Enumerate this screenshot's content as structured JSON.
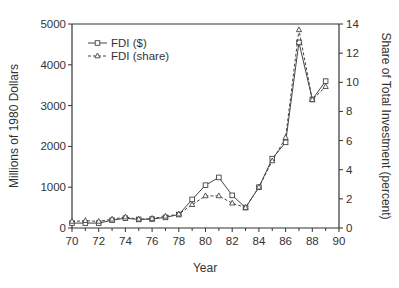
{
  "chart_data": {
    "type": "line",
    "title": "",
    "xlabel": "Year",
    "ylabel": "Millions of 1980 Dollars",
    "y2label": "Share of Total Investment (percent)",
    "x": [
      70,
      71,
      72,
      73,
      74,
      75,
      76,
      77,
      78,
      79,
      80,
      81,
      82,
      83,
      84,
      85,
      86,
      87,
      88,
      89
    ],
    "xlim": [
      70,
      90
    ],
    "ylim": [
      0,
      5000
    ],
    "y2lim": [
      0,
      14
    ],
    "x_ticks": [
      "70",
      "72",
      "74",
      "76",
      "78",
      "80",
      "82",
      "84",
      "86",
      "88",
      "90"
    ],
    "y_ticks": [
      "0",
      "1000",
      "2000",
      "3000",
      "4000",
      "5000"
    ],
    "y2_ticks": [
      "0",
      "2",
      "4",
      "6",
      "8",
      "10",
      "12",
      "14"
    ],
    "grid": false,
    "legend_position": "upper left",
    "series": [
      {
        "name": "FDI ($)",
        "axis": "left",
        "marker": "square",
        "line": "solid",
        "values": [
          120,
          120,
          120,
          190,
          240,
          210,
          220,
          260,
          330,
          700,
          1050,
          1240,
          800,
          500,
          1000,
          1700,
          2100,
          4550,
          3150,
          3600
        ]
      },
      {
        "name": "FDI (share)",
        "axis": "right",
        "marker": "triangle",
        "line": "dashed",
        "values": [
          0.45,
          0.5,
          0.45,
          0.6,
          0.75,
          0.6,
          0.65,
          0.8,
          0.95,
          1.6,
          2.2,
          2.2,
          1.7,
          1.4,
          2.8,
          4.6,
          6.2,
          13.6,
          8.8,
          9.7
        ]
      }
    ]
  },
  "colors": {
    "line": "#444444",
    "axis": "#333333",
    "background": "#ffffff"
  }
}
